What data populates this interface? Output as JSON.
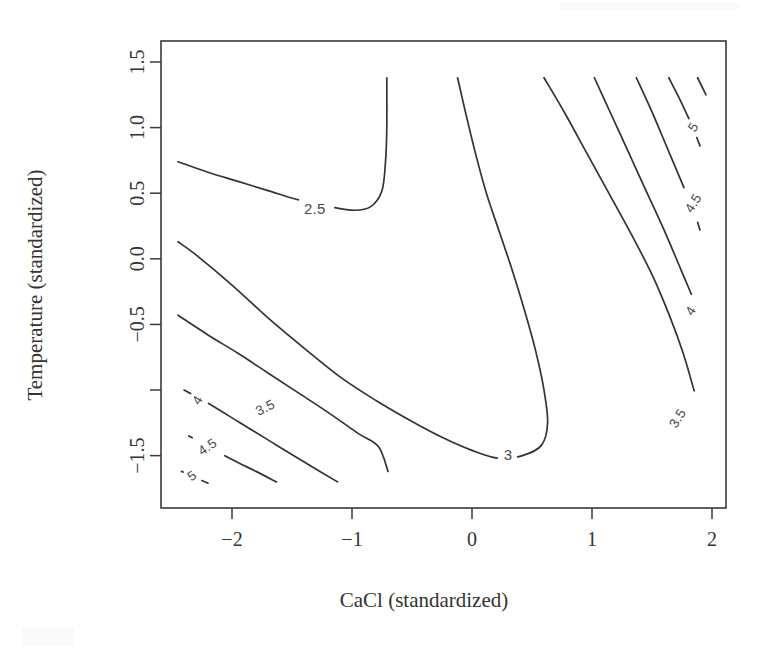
{
  "figure": {
    "kind": "contour-plot",
    "background_color": "#ffffff",
    "line_color": "#33332f",
    "axis_color": "#3a3a3a",
    "label_color": "#4a4a47"
  },
  "axes": {
    "x_title": "CaCl (standardized)",
    "y_title": "Temperature (standardized)",
    "x_ticks": [
      "−2",
      "−1",
      "0",
      "1",
      "2"
    ],
    "y_ticks": [
      "1.5",
      "1.0",
      "0.5",
      "0.0",
      "−0.5",
      "",
      "−1.5"
    ]
  },
  "chart_data": {
    "type": "contour",
    "title": "",
    "xlabel": "CaCl (standardized)",
    "ylabel": "Temperature (standardized)",
    "xlim": [
      -2.45,
      2.0
    ],
    "ylim": [
      -1.8,
      1.5
    ],
    "xticks": [
      -2,
      -1,
      0,
      1,
      2
    ],
    "xticklabels": [
      "−2",
      "−1",
      "0",
      "1",
      "2"
    ],
    "yticks": [
      1.5,
      1.0,
      0.5,
      0.0,
      -0.5,
      -1.0,
      -1.5
    ],
    "yticklabels": [
      "1.5",
      "1.0",
      "0.5",
      "0.0",
      "−0.5",
      "",
      "−1.5"
    ],
    "grid": false,
    "legend": "none",
    "filled": false,
    "levels": [
      2.5,
      3,
      3.5,
      4,
      4.5,
      5
    ],
    "level_labels": [
      "2.5",
      "3",
      "3.5",
      "4",
      "4.5",
      "5"
    ],
    "surface_shape": "saddle",
    "contours": [
      {
        "level": 2.5,
        "label": "2.5",
        "label_xy": [
          -1.31,
          0.37
        ],
        "label_rotation": 0,
        "shape": "u-valley",
        "points": [
          [
            -2.45,
            0.74
          ],
          [
            -2.2,
            0.66
          ],
          [
            -1.95,
            0.59
          ],
          [
            -1.7,
            0.52
          ],
          [
            -1.45,
            0.45
          ],
          [
            -1.2,
            0.4
          ],
          [
            -0.98,
            0.37
          ],
          [
            -0.84,
            0.4
          ],
          [
            -0.75,
            0.52
          ],
          [
            -0.72,
            0.75
          ],
          [
            -0.71,
            1.0
          ],
          [
            -0.71,
            1.38
          ]
        ]
      },
      {
        "level": 3,
        "label": "3",
        "label_xy": [
          0.3,
          -1.5
        ],
        "label_rotation": 0,
        "shape": "u-valley",
        "points": [
          [
            -0.12,
            1.38
          ],
          [
            -0.05,
            1.1
          ],
          [
            0.03,
            0.8
          ],
          [
            0.12,
            0.5
          ],
          [
            0.23,
            0.2
          ],
          [
            0.34,
            -0.1
          ],
          [
            0.44,
            -0.4
          ],
          [
            0.53,
            -0.7
          ],
          [
            0.6,
            -1.0
          ],
          [
            0.63,
            -1.25
          ],
          [
            0.58,
            -1.42
          ],
          [
            0.42,
            -1.5
          ],
          [
            0.22,
            -1.52
          ],
          [
            0.0,
            -1.46
          ],
          [
            -0.25,
            -1.36
          ],
          [
            -0.5,
            -1.24
          ],
          [
            -0.8,
            -1.08
          ],
          [
            -1.1,
            -0.9
          ],
          [
            -1.4,
            -0.68
          ],
          [
            -1.7,
            -0.45
          ],
          [
            -2.0,
            -0.2
          ],
          [
            -2.3,
            0.03
          ],
          [
            -2.45,
            0.13
          ]
        ]
      },
      {
        "level": 3.5,
        "label": "3.5",
        "label_xy": [
          -1.72,
          -1.14
        ],
        "label_rotation": 27,
        "shape": "diagonal-lower-left",
        "points": [
          [
            -2.45,
            -0.43
          ],
          [
            -2.2,
            -0.58
          ],
          [
            -1.95,
            -0.72
          ],
          [
            -1.7,
            -0.87
          ],
          [
            -1.45,
            -1.02
          ],
          [
            -1.2,
            -1.17
          ],
          [
            -0.95,
            -1.33
          ],
          [
            -0.78,
            -1.43
          ],
          [
            -0.7,
            -1.62
          ]
        ]
      },
      {
        "level": 4,
        "label": "4",
        "label_xy": [
          -2.28,
          -1.08
        ],
        "label_rotation": 58,
        "shape": "diagonal-lower-left",
        "points": [
          [
            -2.4,
            -1.0
          ],
          [
            -2.2,
            -1.1
          ],
          [
            -1.95,
            -1.24
          ],
          [
            -1.7,
            -1.38
          ],
          [
            -1.45,
            -1.52
          ],
          [
            -1.25,
            -1.63
          ],
          [
            -1.12,
            -1.7
          ]
        ]
      },
      {
        "level": 4.5,
        "label": "4.5",
        "label_xy": [
          -2.2,
          -1.44
        ],
        "label_rotation": 34,
        "shape": "diagonal-lower-left",
        "points": [
          [
            -2.36,
            -1.35
          ],
          [
            -2.2,
            -1.43
          ],
          [
            -2.0,
            -1.53
          ],
          [
            -1.8,
            -1.62
          ],
          [
            -1.63,
            -1.7
          ]
        ]
      },
      {
        "level": 5,
        "label": "5",
        "label_xy": [
          -2.33,
          -1.66
        ],
        "label_rotation": 34,
        "shape": "diagonal-lower-left",
        "points": [
          [
            -2.42,
            -1.62
          ],
          [
            -2.3,
            -1.67
          ],
          [
            -2.2,
            -1.71
          ]
        ]
      },
      {
        "level": 3.5,
        "label": "3.5",
        "label_xy": [
          1.72,
          -1.22
        ],
        "label_rotation": 58,
        "shape": "diagonal-upper-right",
        "points": [
          [
            0.6,
            1.38
          ],
          [
            0.78,
            1.1
          ],
          [
            0.96,
            0.8
          ],
          [
            1.14,
            0.5
          ],
          [
            1.32,
            0.2
          ],
          [
            1.5,
            -0.12
          ],
          [
            1.64,
            -0.42
          ],
          [
            1.76,
            -0.72
          ],
          [
            1.85,
            -1.0
          ],
          [
            1.9,
            -1.14
          ]
        ]
      },
      {
        "level": 4,
        "label": "4",
        "label_xy": [
          1.83,
          -0.4
        ],
        "label_rotation": 58,
        "shape": "diagonal-upper-right",
        "points": [
          [
            1.02,
            1.38
          ],
          [
            1.16,
            1.1
          ],
          [
            1.3,
            0.82
          ],
          [
            1.45,
            0.52
          ],
          [
            1.6,
            0.22
          ],
          [
            1.74,
            -0.08
          ],
          [
            1.86,
            -0.34
          ]
        ]
      },
      {
        "level": 4.5,
        "label": "4.5",
        "label_xy": [
          1.85,
          0.42
        ],
        "label_rotation": 58,
        "shape": "diagonal-upper-right",
        "points": [
          [
            1.37,
            1.38
          ],
          [
            1.5,
            1.12
          ],
          [
            1.62,
            0.86
          ],
          [
            1.74,
            0.6
          ],
          [
            1.86,
            0.33
          ],
          [
            1.9,
            0.22
          ]
        ]
      },
      {
        "level": 5,
        "label": "5",
        "label_xy": [
          1.85,
          1.0
        ],
        "label_rotation": 58,
        "shape": "diagonal-upper-right",
        "points": [
          [
            1.64,
            1.38
          ],
          [
            1.74,
            1.2
          ],
          [
            1.84,
            1.0
          ],
          [
            1.9,
            0.86
          ]
        ]
      },
      {
        "level": 5,
        "label": "",
        "label_xy": null,
        "label_rotation": 58,
        "shape": "corner-fragment-upper-right",
        "points": [
          [
            1.88,
            1.38
          ],
          [
            1.95,
            1.25
          ]
        ]
      }
    ]
  }
}
